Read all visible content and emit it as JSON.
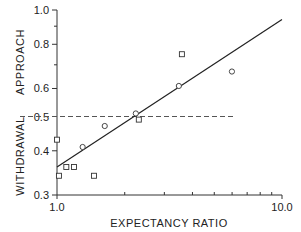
{
  "chart_data": {
    "type": "scatter",
    "title": "",
    "xlabel": "EXPECTANCY RATIO",
    "ylabel_upper": "APPROACH",
    "ylabel_lower": "WITHDRAWAL",
    "xscale": "log",
    "yscale": "log",
    "xlim": [
      1.0,
      10.0
    ],
    "ylim": [
      0.3,
      1.0
    ],
    "x_tick_labels": [
      "1.0",
      "10.0"
    ],
    "x_minor_ticks": [
      2,
      3,
      4,
      5,
      6,
      7,
      8,
      9
    ],
    "y_ticks": [
      0.3,
      0.4,
      0.5,
      0.6,
      0.8,
      1.0
    ],
    "y_tick_labels": [
      "0.3",
      "0.4",
      "0.5",
      "0.6",
      "0.8",
      "1.0"
    ],
    "y_minor_ticks": [
      0.7,
      0.9
    ],
    "grid": false,
    "series": [
      {
        "name": "squares",
        "marker": "square",
        "points": [
          {
            "x": 1.0,
            "y": 0.43
          },
          {
            "x": 1.02,
            "y": 0.34
          },
          {
            "x": 1.1,
            "y": 0.36
          },
          {
            "x": 1.19,
            "y": 0.36
          },
          {
            "x": 1.46,
            "y": 0.34
          },
          {
            "x": 2.31,
            "y": 0.49
          },
          {
            "x": 3.59,
            "y": 0.75
          }
        ]
      },
      {
        "name": "circles",
        "marker": "circle",
        "points": [
          {
            "x": 1.3,
            "y": 0.41
          },
          {
            "x": 1.63,
            "y": 0.47
          },
          {
            "x": 2.24,
            "y": 0.51
          },
          {
            "x": 3.48,
            "y": 0.61
          },
          {
            "x": 5.99,
            "y": 0.67
          }
        ]
      }
    ],
    "fit_line": {
      "x": [
        1.0,
        10.0
      ],
      "y": [
        0.36,
        0.94
      ]
    },
    "reference_line": {
      "y": 0.5,
      "style": "dashed",
      "x_end": 6.2
    }
  }
}
